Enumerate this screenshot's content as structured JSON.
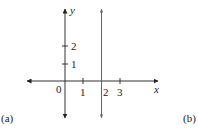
{
  "diagram": {
    "type": "coordinate-plane",
    "axes": {
      "x_label": "x",
      "y_label": "y",
      "origin_label": "0",
      "x_ticks": [
        "1",
        "2",
        "3"
      ],
      "y_ticks": [
        "1",
        "2"
      ]
    },
    "vertical_line": {
      "equation": "x = 2",
      "x_value": 2
    },
    "panel_labels": {
      "left": "(a)",
      "right": "(b)"
    },
    "colors": {
      "axis": "#333333",
      "line": "#555555",
      "background": "#ffffff"
    }
  }
}
